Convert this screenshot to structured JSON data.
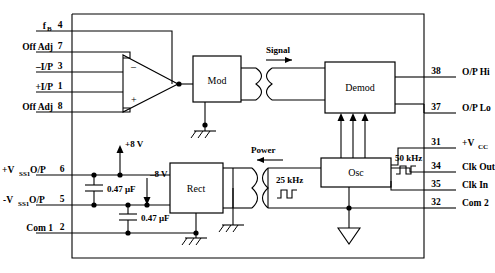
{
  "diagram": {
    "left_pins": [
      {
        "label": "f",
        "sublabel": "B",
        "number": "4"
      },
      {
        "label": "Off Adj",
        "sublabel": "",
        "number": "7"
      },
      {
        "label": "–I/P",
        "sublabel": "",
        "number": "3"
      },
      {
        "label": "+I/P",
        "sublabel": "",
        "number": "1"
      },
      {
        "label": "Off Adj",
        "sublabel": "",
        "number": "8"
      },
      {
        "label": "+V",
        "sublabel": "SS1",
        "suffix": " O/P",
        "number": "6"
      },
      {
        "label": "-V",
        "sublabel": "SS1",
        "suffix": " O/P",
        "number": "5"
      },
      {
        "label": "Com 1",
        "sublabel": "",
        "number": "2"
      }
    ],
    "right_pins": [
      {
        "number": "38",
        "label": "O/P  Hi"
      },
      {
        "number": "37",
        "label": "O/P  Lo"
      },
      {
        "number": "31",
        "label": "+V",
        "sublabel": "CC"
      },
      {
        "number": "34",
        "label": "Clk Out"
      },
      {
        "number": "35",
        "label": "Clk In"
      },
      {
        "number": "32",
        "label": "Com 2"
      }
    ],
    "blocks": [
      {
        "name": "mod",
        "label": "Mod"
      },
      {
        "name": "demod",
        "label": "Demod"
      },
      {
        "name": "rect",
        "label": "Rect"
      },
      {
        "name": "osc",
        "label": "Osc"
      }
    ],
    "annotations": {
      "signal": "Signal",
      "power": "Power",
      "volt_pos": "+8 V",
      "volt_neg": "–8 V",
      "cap1": "0.47 μF",
      "cap2": "0.47 μF",
      "freq_low": "25 kHz",
      "freq_high": "50 kHz"
    },
    "symbols": {
      "amplifier_minus": "–",
      "amplifier_plus": "+"
    }
  }
}
